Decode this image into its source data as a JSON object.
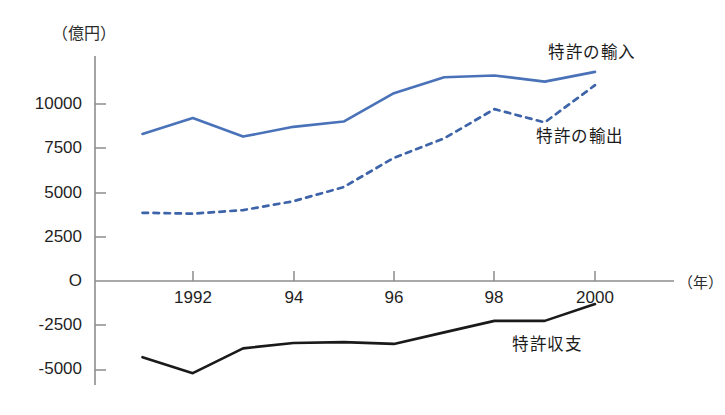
{
  "chart_data": {
    "type": "line",
    "title": "",
    "xlabel": "(年)",
    "ylabel": "(億円)",
    "y_unit_label": "（億円）",
    "x_unit_label": "（年）",
    "x": [
      1991,
      1992,
      1993,
      1994,
      1995,
      1996,
      1997,
      1998,
      1999,
      2000
    ],
    "xtick_values": [
      1992,
      1994,
      1996,
      1998,
      2000
    ],
    "xtick_labels": [
      "1992",
      "94",
      "96",
      "98",
      "2000"
    ],
    "ytick_values": [
      10000,
      7500,
      5000,
      2500,
      0,
      -2500,
      -5000
    ],
    "ytick_labels": [
      "10000",
      "7500",
      "5000",
      "2500",
      "O",
      "-2500",
      "-5000"
    ],
    "ylim": [
      -5800,
      12600
    ],
    "xlim": [
      1991,
      2000
    ],
    "grid": false,
    "legend": "inline-annotations",
    "series": [
      {
        "name": "特許の輸入",
        "style": "solid",
        "color": "#4a72b8",
        "values": [
          8300,
          9200,
          8150,
          8700,
          9000,
          10600,
          11500,
          11600,
          11250,
          11800
        ]
      },
      {
        "name": "特許の輸出",
        "style": "dotted",
        "color": "#3d63a8",
        "values": [
          3850,
          3800,
          4000,
          4500,
          5300,
          6950,
          8050,
          9700,
          8950,
          11050
        ]
      },
      {
        "name": "特許収支",
        "style": "solid",
        "color": "#1a1a1a",
        "values": [
          -4300,
          -5200,
          -3800,
          -3500,
          -3450,
          -3550,
          -2900,
          -2250,
          -2250,
          -1300
        ]
      }
    ],
    "annotations": [
      {
        "text": "特許の輸入",
        "x_px": 548,
        "y_px": 39
      },
      {
        "text": "特許の輸出",
        "x_px": 536,
        "y_px": 123
      },
      {
        "text": "特許収支",
        "x_px": 512,
        "y_px": 331
      }
    ]
  },
  "axes": {
    "y_unit": "（億円）",
    "x_unit": "（年）"
  }
}
